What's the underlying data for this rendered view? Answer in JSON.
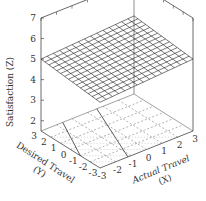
{
  "chart_data": {
    "type": "surface3d",
    "title": "",
    "zlabel": "Satisfaction (Z)",
    "xlabel": "Actual Travel (X)",
    "ylabel": "Desired Travel (Y)",
    "xlabel_lines": [
      "Actual Travel",
      "(X)"
    ],
    "ylabel_lines": [
      "Desired Travel",
      "(Y)"
    ],
    "x_ticks": [
      "-3",
      "-2",
      "-1",
      "0",
      "1",
      "2",
      "3"
    ],
    "y_ticks": [
      "3",
      "2",
      "1",
      "0",
      "-1",
      "-2",
      "-3"
    ],
    "z_ticks": [
      "2",
      "3",
      "4",
      "5",
      "6",
      "7"
    ],
    "xlim": [
      -3,
      3
    ],
    "ylim": [
      -3,
      3
    ],
    "zlim": [
      1.5,
      7
    ],
    "surface": {
      "description": "Nearly flat plane slightly tilted, around Z = 5 to 5.4",
      "corners": {
        "x-3_y3": 5.0,
        "x-3_y-3": 4.7,
        "x3_y3": 5.3,
        "x3_y-3": 5.0
      },
      "grid_lines": 15
    },
    "floor_contours": "dashed contour projection with two solid diagonal lines",
    "grid": false,
    "legend": null
  }
}
